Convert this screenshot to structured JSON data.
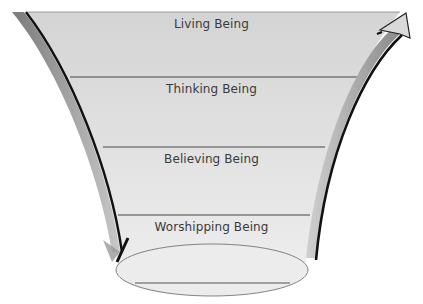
{
  "diagram": {
    "type": "funnel",
    "levels": [
      {
        "label": "Living Being"
      },
      {
        "label": "Thinking Being"
      },
      {
        "label": "Believing Being"
      },
      {
        "label": "Worshipping Being"
      }
    ],
    "arrows": {
      "left": "downward-curved-arrow",
      "right": "upward-curved-arrow"
    },
    "colors": {
      "funnel_fill": "#d8d8d8",
      "funnel_fill_bottom": "#ececec",
      "divider": "#444444",
      "arrow_gray": "#8e8e8e",
      "arrow_dark": "#111111",
      "text": "#3a3a3a"
    }
  }
}
